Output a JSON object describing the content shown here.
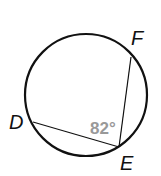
{
  "diagram": {
    "circle": {
      "cx": 86,
      "cy": 95,
      "r": 61
    },
    "points": {
      "D": {
        "x": 33,
        "y": 122,
        "label": "D",
        "lx": 9,
        "ly": 129
      },
      "E": {
        "x": 119,
        "y": 147,
        "label": "E",
        "lx": 120,
        "ly": 170
      },
      "F": {
        "x": 131,
        "y": 57,
        "label": "F",
        "lx": 131,
        "ly": 45
      }
    },
    "angle_label": "82°",
    "colors": {
      "stroke": "#111111",
      "angle": "#999999"
    }
  }
}
